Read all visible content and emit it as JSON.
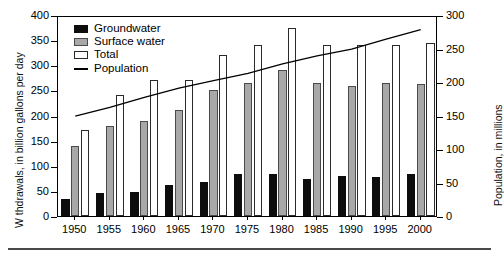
{
  "axes": {
    "left_title": "W thdrawals, in billion gallons per day",
    "right_title": "Population, in millions",
    "left_ticks": [
      "400",
      "350",
      "300",
      "250",
      "200",
      "150",
      "100",
      "50",
      "0"
    ],
    "right_ticks": [
      "300",
      "250",
      "200",
      "150",
      "100",
      "50",
      "0"
    ],
    "x_ticks": [
      "1950",
      "1955",
      "1960",
      "1965",
      "1970",
      "1975",
      "1980",
      "1985",
      "1990",
      "1995",
      "2000"
    ]
  },
  "legend": {
    "items": [
      {
        "label": "Groundwater",
        "marker": "filled-black-square",
        "color": "#0d0d0d"
      },
      {
        "label": "Surface water",
        "marker": "filled-gray-square",
        "color": "#a8a8a8"
      },
      {
        "label": "Total",
        "marker": "open-square",
        "color": "#ffffff"
      },
      {
        "label": "Population",
        "marker": "line-segment",
        "color": "#000000"
      }
    ]
  },
  "chart_data": {
    "type": "bar",
    "title": "",
    "xlabel": "",
    "ylabel": "W thdrawals, in billion gallons per day",
    "y2label": "Population, in millions",
    "categories": [
      "1950",
      "1955",
      "1960",
      "1965",
      "1970",
      "1975",
      "1980",
      "1985",
      "1990",
      "1995",
      "2000"
    ],
    "ylim": [
      0,
      400
    ],
    "y2lim": [
      0,
      300
    ],
    "grid": false,
    "legend_position": "upper-left-inside",
    "series": [
      {
        "name": "Groundwater",
        "type": "bar",
        "axis": "left",
        "color": "#0d0d0d",
        "values": [
          34,
          46,
          48,
          62,
          68,
          83,
          83,
          74,
          79,
          77,
          84
        ]
      },
      {
        "name": "Surface water",
        "type": "bar",
        "axis": "left",
        "color": "#a8a8a8",
        "values": [
          140,
          180,
          190,
          210,
          250,
          265,
          290,
          265,
          259,
          264,
          262
        ]
      },
      {
        "name": "Total",
        "type": "bar",
        "axis": "left",
        "color": "#ffffff",
        "values": [
          172,
          240,
          270,
          270,
          320,
          340,
          375,
          340,
          340,
          340,
          345
        ]
      },
      {
        "name": "Population",
        "type": "line",
        "axis": "right",
        "color": "#000000",
        "values": [
          152,
          165,
          180,
          194,
          205,
          216,
          230,
          242,
          252,
          267,
          281
        ]
      }
    ]
  }
}
